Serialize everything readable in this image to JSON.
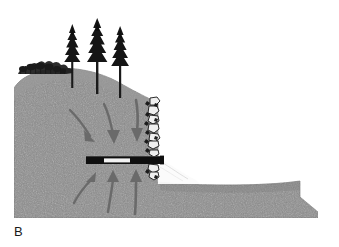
{
  "figure": {
    "panel_label": "B",
    "background_color": "#ffffff"
  },
  "palette": {
    "soil_fill": "#8c8c8c",
    "soil_fill_light": "#9a9a9a",
    "soil_edge": "#6f6f6f",
    "arrow_color": "#6a6a6a",
    "pipe_dark": "#0f0f0f",
    "pipe_light": "#f2f2f2",
    "rock_dark": "#151515",
    "rock_light": "#efefef",
    "vegetation_color": "#1a1a1a",
    "outflow_color": "#fbfbfb",
    "label_color": "#1a1a1a"
  },
  "terrain": {
    "name": "hillslope",
    "description": "Gray stippled soil mass, crest at upper left sloping down to a vertical cut face at center-right, with a low bench extending to the right edge",
    "crest_elevation_px": 76,
    "cut_face_x_px": 158,
    "bench_elevation_px": 186,
    "base_elevation_px": 218
  },
  "vegetation": {
    "shrub": {
      "name": "crest-shrub",
      "count": 1,
      "x_px": 18,
      "y_px": 68
    },
    "trees": [
      {
        "name": "conifer-tree-1",
        "x_px": 72,
        "top_y_px": 24,
        "base_y_px": 88,
        "height_px": 64
      },
      {
        "name": "conifer-tree-2",
        "x_px": 97,
        "top_y_px": 18,
        "base_y_px": 94,
        "height_px": 76
      },
      {
        "name": "conifer-tree-3",
        "x_px": 120,
        "top_y_px": 26,
        "base_y_px": 98,
        "height_px": 72
      }
    ]
  },
  "drain": {
    "name": "horizontal-drain-pipe",
    "y_px": 160,
    "x_start_px": 86,
    "x_end_px": 163,
    "segments": [
      {
        "label": "solid-pipe-left",
        "type": "solid",
        "x_start_px": 86,
        "x_end_px": 104
      },
      {
        "label": "perforated-screen",
        "type": "perforated",
        "x_start_px": 104,
        "x_end_px": 130
      },
      {
        "label": "solid-pipe-right",
        "type": "solid",
        "x_start_px": 130,
        "x_end_px": 163
      }
    ]
  },
  "riprap": {
    "name": "rock-face-riprap",
    "description": "Column of angular boulders armoring the vertical cut face",
    "x_px": 150,
    "y_top_px": 98,
    "y_bottom_px": 178,
    "rock_count": 12
  },
  "outflow": {
    "name": "drain-outflow",
    "description": "Light-toned discharge fan below the pipe outlet at the cut face",
    "x_px": 160,
    "y_px": 162
  },
  "flow_arrows": {
    "description": "Curved arrows indicating groundwater seepage converging on the drain",
    "upper_group": [
      {
        "name": "seepage-arrow-upper-1",
        "direction": "down-right"
      },
      {
        "name": "seepage-arrow-upper-2",
        "direction": "down-right"
      },
      {
        "name": "seepage-arrow-upper-3",
        "direction": "down"
      }
    ],
    "lower_group": [
      {
        "name": "seepage-arrow-lower-1",
        "direction": "up-right"
      },
      {
        "name": "seepage-arrow-lower-2",
        "direction": "up"
      },
      {
        "name": "seepage-arrow-lower-3",
        "direction": "up"
      }
    ]
  }
}
